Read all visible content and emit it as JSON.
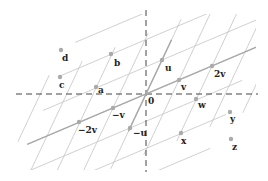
{
  "diagram": {
    "title": "",
    "origin": {
      "label": "0",
      "x": 146,
      "y": 94
    },
    "basis": {
      "u": {
        "dx": 16,
        "dy": -34
      },
      "v": {
        "dx": 33,
        "dy": -14
      }
    },
    "points": [
      {
        "name": "u",
        "label": "u",
        "x": 162,
        "y": 60,
        "lx": 165,
        "ly": 71
      },
      {
        "name": "v",
        "label": "v",
        "x": 179,
        "y": 80,
        "lx": 181,
        "ly": 90
      },
      {
        "name": "2v",
        "label": "2v",
        "x": 212,
        "y": 66,
        "lx": 214,
        "ly": 77
      },
      {
        "name": "neg-v",
        "label": "−v",
        "x": 113,
        "y": 108,
        "lx": 112,
        "ly": 118
      },
      {
        "name": "neg-2v",
        "label": "−2v",
        "x": 79,
        "y": 122,
        "lx": 78,
        "ly": 133
      },
      {
        "name": "neg-u",
        "label": "−u",
        "x": 130,
        "y": 128,
        "lx": 133,
        "ly": 136
      },
      {
        "name": "a",
        "label": "a",
        "x": 96,
        "y": 87,
        "lx": 98,
        "ly": 93
      },
      {
        "name": "b",
        "label": "b",
        "x": 111,
        "y": 54,
        "lx": 114,
        "ly": 66
      },
      {
        "name": "c",
        "label": "c",
        "x": 60,
        "y": 77,
        "lx": 59,
        "ly": 88
      },
      {
        "name": "d",
        "label": "d",
        "x": 61,
        "y": 50,
        "lx": 62,
        "ly": 61
      },
      {
        "name": "w",
        "label": "w",
        "x": 196,
        "y": 99,
        "lx": 198,
        "ly": 108
      },
      {
        "name": "x",
        "label": "x",
        "x": 181,
        "y": 133,
        "lx": 181,
        "ly": 144
      },
      {
        "name": "y",
        "label": "y",
        "x": 230,
        "y": 112,
        "lx": 230,
        "ly": 122
      },
      {
        "name": "z",
        "label": "z",
        "x": 231,
        "y": 139,
        "lx": 232,
        "ly": 150
      }
    ],
    "colors": {
      "grid": "#c4c4c4",
      "grid_bold": "#a9a9a9",
      "axis": "#444444",
      "point": "#aaaaaa",
      "label": "#222222"
    }
  }
}
